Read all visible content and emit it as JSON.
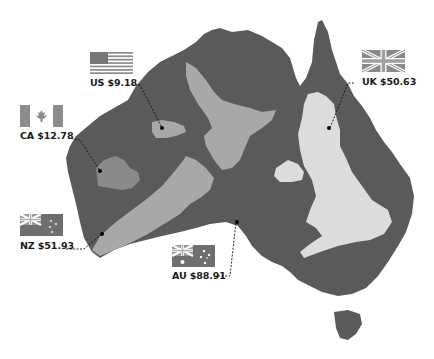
{
  "colors": {
    "australia": "#5a5a5a",
    "overlay_country": "#a8a8a8",
    "uk_overlay": "#dcdcdc",
    "canada_overlay": "#8a8a8a",
    "background": "#ffffff",
    "leader_line": "#111111"
  },
  "callouts": [
    {
      "id": "us",
      "code": "US",
      "value": "$9.18",
      "label": "US $9.18",
      "flag": "us-flag-icon"
    },
    {
      "id": "ca",
      "code": "CA",
      "value": "$12.78",
      "label": "CA $12.78",
      "flag": "canada-flag-icon"
    },
    {
      "id": "nz",
      "code": "NZ",
      "value": "$51.93",
      "label": "NZ $51.93",
      "flag": "new-zealand-flag-icon"
    },
    {
      "id": "au",
      "code": "AU",
      "value": "$88.91",
      "label": "AU $88.91",
      "flag": "australia-flag-icon"
    },
    {
      "id": "uk",
      "code": "UK",
      "value": "$50.63",
      "label": "UK $50.63",
      "flag": "uk-flag-icon"
    }
  ]
}
